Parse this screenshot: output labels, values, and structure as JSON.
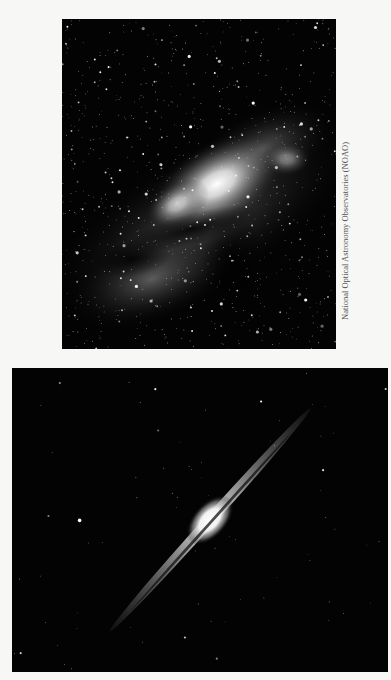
{
  "figure": {
    "top_image": {
      "subject": "Milky Way galactic center star field",
      "alt": "Dense star field with bright glowing galactic center and dark dust lanes"
    },
    "bottom_image": {
      "subject": "Edge-on spiral galaxy",
      "alt": "Thin edge-on spiral galaxy with bright central bulge and dust lane on black background"
    },
    "credit": "National Optical Astronomy Observatories (NOAO)"
  }
}
